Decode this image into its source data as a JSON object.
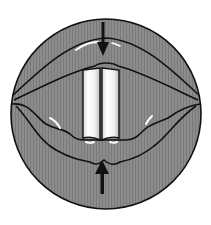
{
  "figure": {
    "description": "Laryngoscopic view of the vocal folds with compression arrows",
    "colors": {
      "background": "#ffffff",
      "tissue": "#8a8a8a",
      "tissue_dark": "#6e6e6e",
      "outline": "#111111",
      "cords": "#f4f4f4",
      "cords_shade": "#c8c8c8",
      "highlight": "#ffffff",
      "arrow": "#111111"
    },
    "arrows": [
      {
        "direction": "down",
        "position": "top"
      },
      {
        "direction": "up",
        "position": "bottom"
      }
    ]
  }
}
